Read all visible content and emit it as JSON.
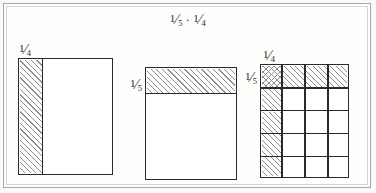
{
  "figure": {
    "title": {
      "left_fraction": {
        "numerator": "1",
        "solidus": "⁄",
        "denominator": "5"
      },
      "operator": "·",
      "right_fraction": {
        "numerator": "1",
        "solidus": "⁄",
        "denominator": "4"
      },
      "plain_text": "1⁄5 · 1⁄4"
    },
    "background_color": "#fdfdfb",
    "frame_color": "#a8a8a8",
    "line_color": "#2a2a2a",
    "hatch_color": "#8e8e8e",
    "panels": [
      {
        "name": "quarter-rectangle",
        "label_top": {
          "numerator": "1",
          "solidus": "⁄",
          "denominator": "4"
        },
        "columns": 4,
        "rows": 1,
        "shaded_columns": 1,
        "shaded_fraction": "1/4",
        "hatch_style": "diagonal-right"
      },
      {
        "name": "fifth-rectangle",
        "label_left": {
          "numerator": "1",
          "solidus": "⁄",
          "denominator": "5"
        },
        "columns": 1,
        "rows": 5,
        "shaded_rows": 1,
        "shaded_fraction": "1/5",
        "hatch_style": "diagonal-right"
      },
      {
        "name": "product-grid",
        "label_top": {
          "numerator": "1",
          "solidus": "⁄",
          "denominator": "4"
        },
        "label_left": {
          "numerator": "1",
          "solidus": "⁄",
          "denominator": "5"
        },
        "columns": 4,
        "rows": 5,
        "total_cells": 20,
        "shaded_top_row_cells": 4,
        "shaded_left_column_cells": 5,
        "cross_hatched_cells": 1,
        "product_fraction": "1/20",
        "hatch_style": "diagonal-right-and-cross"
      }
    ]
  }
}
